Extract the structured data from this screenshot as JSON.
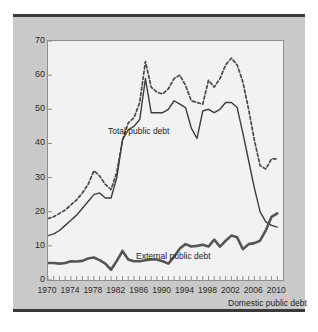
{
  "chart_data": {
    "type": "line",
    "title": "",
    "subtitle": "",
    "xlabel": "",
    "ylabel": "",
    "xlim": [
      1970,
      2011
    ],
    "ylim": [
      0,
      70
    ],
    "yticks": [
      0,
      10,
      20,
      30,
      40,
      50,
      60,
      70
    ],
    "xticks": [
      1970,
      1974,
      1978,
      1982,
      1986,
      1990,
      1994,
      1998,
      2002,
      2006,
      2010
    ],
    "x_minor_tick_interval": 1,
    "grid": false,
    "legend_position": "inline-annotations",
    "x": [
      1970,
      1971,
      1972,
      1973,
      1974,
      1975,
      1976,
      1977,
      1978,
      1979,
      1980,
      1981,
      1982,
      1983,
      1984,
      1985,
      1986,
      1987,
      1988,
      1989,
      1990,
      1991,
      1992,
      1993,
      1994,
      1995,
      1996,
      1997,
      1998,
      1999,
      2000,
      2001,
      2002,
      2003,
      2004,
      2005,
      2006,
      2007,
      2008,
      2009,
      2010
    ],
    "series": [
      {
        "name": "Total public debt",
        "style": "dashed",
        "color": "#4a4a4a",
        "values": [
          18,
          18.5,
          19.5,
          20.5,
          22,
          23.5,
          25.5,
          28,
          32,
          30.5,
          28,
          26.5,
          31.5,
          41,
          46,
          47.5,
          52,
          64,
          56.5,
          55,
          54.5,
          56,
          59,
          60,
          57,
          52.5,
          52,
          51.5,
          58.5,
          56.5,
          59,
          63,
          65,
          63,
          58,
          50,
          41,
          33.5,
          32.5,
          35.5,
          35.5
        ]
      },
      {
        "name": "External public debt",
        "style": "solid-thin",
        "color": "#3d3d3d",
        "values": [
          13,
          13.5,
          14.5,
          16,
          17.5,
          19,
          21,
          23,
          25,
          25.5,
          24,
          24,
          30,
          41,
          44,
          45,
          47,
          59,
          49,
          49,
          49,
          50,
          52.5,
          51.5,
          50.5,
          44.5,
          41.5,
          49.5,
          50,
          49,
          50,
          52,
          52,
          50.5,
          43,
          35,
          27,
          20,
          17,
          16,
          15.5
        ]
      },
      {
        "name": "Domestic public debt",
        "style": "solid-thick",
        "color": "#555555",
        "values": [
          5,
          5,
          4.8,
          5,
          5.5,
          5.4,
          5.6,
          6.3,
          6.6,
          5.8,
          4.8,
          3,
          5.6,
          8.5,
          6,
          5.5,
          5.5,
          5.8,
          6,
          6,
          5.5,
          4.8,
          6.8,
          9.2,
          10.5,
          9.8,
          10,
          10.3,
          9.8,
          11.8,
          9.8,
          11.5,
          13,
          12.5,
          9,
          10.5,
          10.8,
          11.5,
          14.5,
          18.5,
          19.5
        ]
      }
    ],
    "annotations": [
      {
        "text": "Total public debt",
        "series": "Total public debt"
      },
      {
        "text": "External public debt",
        "series": "External public debt"
      },
      {
        "text": "Domestic public debt",
        "series": "Domestic public debt"
      }
    ]
  },
  "colors": {
    "page_background": "#ffffff",
    "panel_background": "#c9c9c9",
    "plot_background": "#f2f2f2",
    "rule": "#3a3a3a",
    "axis": "#8d8d8d",
    "text": "#2b2b2b"
  }
}
